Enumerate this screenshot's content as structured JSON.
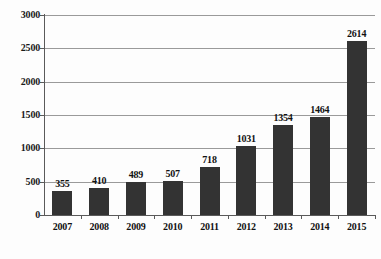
{
  "chart_data": {
    "type": "bar",
    "title": "",
    "subtitle": "",
    "xlabel": "",
    "ylabel": "",
    "categories": [
      "2007",
      "2008",
      "2009",
      "2010",
      "2011",
      "2012",
      "2013",
      "2014",
      "2015"
    ],
    "values": [
      355,
      410,
      489,
      507,
      718,
      1031,
      1354,
      1464,
      2614
    ],
    "value_labels": [
      "355",
      "410",
      "489",
      "507",
      "718",
      "1031",
      "1354",
      "1464",
      "2614"
    ],
    "ylim": [
      0,
      3000
    ],
    "ytick_labels": [
      "0",
      "500",
      "1000",
      "1500",
      "2000",
      "2500",
      "3000"
    ],
    "ytick_values": [
      0,
      500,
      1000,
      1500,
      2000,
      2500,
      3000
    ],
    "grid": true,
    "grid_axis": "y",
    "legend": false,
    "legend_position": "none",
    "annotations": [],
    "bar_color": "#333333",
    "grid_color": "#9a9a9a",
    "axis_color": "#5a5a5a",
    "background_color": "#fdfdfd"
  },
  "figure": {
    "caption": ""
  }
}
